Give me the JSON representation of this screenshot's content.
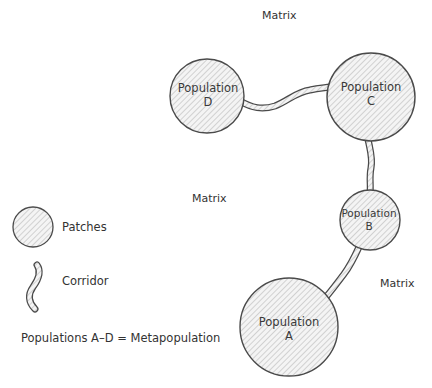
{
  "diagram": {
    "title": "",
    "matrix_labels": [
      {
        "text": "Matrix",
        "x": 262,
        "y": 10
      },
      {
        "text": "Matrix",
        "x": 192,
        "y": 193
      },
      {
        "text": "Matrix",
        "x": 380,
        "y": 278
      }
    ],
    "populations": [
      {
        "id": "A",
        "line1": "Population",
        "line2": "A",
        "cx": 289,
        "cy": 327,
        "r": 49
      },
      {
        "id": "B",
        "line1": "Population",
        "line2": "B",
        "cx": 370,
        "cy": 220,
        "r": 30
      },
      {
        "id": "C",
        "line1": "Population",
        "line2": "C",
        "cx": 371,
        "cy": 97,
        "r": 44
      },
      {
        "id": "D",
        "line1": "Population",
        "line2": "D",
        "cx": 207,
        "cy": 96,
        "r": 37
      }
    ],
    "corridors": [
      {
        "from": "D",
        "to": "C"
      },
      {
        "from": "C",
        "to": "B"
      },
      {
        "from": "B",
        "to": "A"
      }
    ],
    "legend": {
      "patches_label": "Patches",
      "corridor_label": "Corridor",
      "note": "Populations A–D = Metapopulation"
    },
    "colors": {
      "outline": "#4a4a4a",
      "hatch": "#b8b8b8",
      "fill": "#f2f2f2",
      "text": "#333333"
    }
  }
}
